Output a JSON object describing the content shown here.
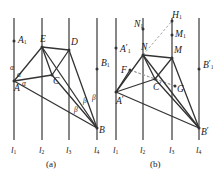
{
  "figure": {
    "stroke_color": "#333333",
    "rule_color": "#555555",
    "dash_color": "#999999",
    "background": "#ffffff"
  },
  "panel_a": {
    "caption": "(a)",
    "rules": [
      {
        "name": "l1",
        "label": "l",
        "sub": "1",
        "x": 14
      },
      {
        "name": "l2",
        "label": "l",
        "sub": "2",
        "x": 42
      },
      {
        "name": "l3",
        "label": "l",
        "sub": "3",
        "x": 69
      },
      {
        "name": "l4",
        "label": "l",
        "sub": "4",
        "x": 97
      }
    ],
    "rule_top": 18,
    "rule_bottom": 140,
    "points": [
      {
        "name": "A",
        "label": "A",
        "sub": "",
        "prime": false,
        "x": 14,
        "y": 81
      },
      {
        "name": "A1",
        "label": "A",
        "sub": "1",
        "prime": false,
        "x": 14,
        "y": 41
      },
      {
        "name": "E",
        "label": "E",
        "sub": "",
        "prime": false,
        "x": 42,
        "y": 47
      },
      {
        "name": "D",
        "label": "D",
        "sub": "",
        "prime": false,
        "x": 69,
        "y": 50
      },
      {
        "name": "C",
        "label": "C",
        "sub": "",
        "prime": false,
        "x": 52,
        "y": 75
      },
      {
        "name": "B",
        "label": "B",
        "sub": "",
        "prime": false,
        "x": 97,
        "y": 128
      },
      {
        "name": "B1",
        "label": "B",
        "sub": "1",
        "prime": false,
        "x": 97,
        "y": 69
      }
    ],
    "segments": [
      [
        "A",
        "E"
      ],
      [
        "A",
        "C"
      ],
      [
        "A",
        "B"
      ],
      [
        "E",
        "D"
      ],
      [
        "E",
        "C"
      ],
      [
        "E",
        "B"
      ],
      [
        "D",
        "C"
      ],
      [
        "D",
        "B"
      ],
      [
        "C",
        "B"
      ]
    ],
    "angles": [
      {
        "name": "alpha-1",
        "glyph": "α",
        "x": 10,
        "y": 64
      },
      {
        "name": "alpha-2",
        "glyph": "α",
        "x": 17,
        "y": 71
      },
      {
        "name": "alpha-3",
        "glyph": "α",
        "x": 22,
        "y": 80
      },
      {
        "name": "beta-1",
        "glyph": "β",
        "x": 74,
        "y": 106
      },
      {
        "name": "beta-2",
        "glyph": "β",
        "x": 83,
        "y": 97
      },
      {
        "name": "beta-3",
        "glyph": "β",
        "x": 92,
        "y": 94
      }
    ]
  },
  "panel_b": {
    "caption": "(b)",
    "rules": [
      {
        "name": "l1p",
        "label": "l",
        "sub": "1",
        "x": 116
      },
      {
        "name": "l2p",
        "label": "l",
        "sub": "2",
        "x": 143
      },
      {
        "name": "l3p",
        "label": "l",
        "sub": "3",
        "x": 172
      },
      {
        "name": "l4p",
        "label": "l",
        "sub": "4",
        "x": 199
      }
    ],
    "rule_top": 18,
    "rule_bottom": 140,
    "points": [
      {
        "name": "Ap",
        "label": "A",
        "sub": "",
        "prime": true,
        "x": 116,
        "y": 92
      },
      {
        "name": "A1p",
        "label": "A",
        "sub": "1",
        "prime": true,
        "x": 116,
        "y": 48
      },
      {
        "name": "N",
        "label": "N",
        "sub": "",
        "prime": false,
        "x": 143,
        "y": 55
      },
      {
        "name": "N1",
        "label": "N",
        "sub": "1",
        "prime": false,
        "x": 143,
        "y": 29
      },
      {
        "name": "M",
        "label": "M",
        "sub": "",
        "prime": false,
        "x": 172,
        "y": 58
      },
      {
        "name": "M1",
        "label": "M",
        "sub": "1",
        "prime": false,
        "x": 172,
        "y": 35
      },
      {
        "name": "H1",
        "label": "H",
        "sub": "1",
        "prime": false,
        "x": 172,
        "y": 21
      },
      {
        "name": "Cp",
        "label": "C",
        "sub": "",
        "prime": true,
        "x": 155,
        "y": 79
      },
      {
        "name": "F",
        "label": "F",
        "sub": "",
        "prime": false,
        "x": 130,
        "y": 70
      },
      {
        "name": "G",
        "label": "G",
        "sub": "",
        "prime": false,
        "x": 175,
        "y": 86
      },
      {
        "name": "Bp",
        "label": "B",
        "sub": "",
        "prime": true,
        "x": 199,
        "y": 128
      },
      {
        "name": "B1p",
        "label": "B",
        "sub": "1",
        "prime": true,
        "x": 199,
        "y": 69
      }
    ],
    "segments": [
      [
        "Ap",
        "N"
      ],
      [
        "Ap",
        "Cp"
      ],
      [
        "Ap",
        "Bp"
      ],
      [
        "Ap",
        "F"
      ],
      [
        "N",
        "M"
      ],
      [
        "N",
        "Cp"
      ],
      [
        "N",
        "Bp"
      ],
      [
        "M",
        "Cp"
      ],
      [
        "M",
        "Bp"
      ],
      [
        "Cp",
        "Bp"
      ]
    ],
    "dashed_segments": [
      [
        "N",
        "H1"
      ],
      [
        "F",
        "G"
      ],
      [
        "F",
        "Cp"
      ],
      [
        "Cp",
        "G"
      ]
    ]
  }
}
